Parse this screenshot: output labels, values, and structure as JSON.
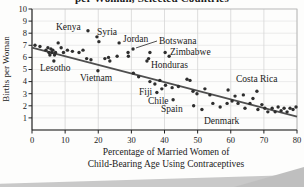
{
  "figure": {
    "xlabel_line1": "Percentage of Married Women of",
    "xlabel_line2": "Child-Bearing Age Using Contraceptives"
  },
  "chart_data": {
    "type": "scatter",
    "title_visible": "per Woman, Selected Countries",
    "xlabel": "Percentage of Married Women of Child-Bearing Age Using Contraceptives",
    "ylabel": "Births per Woman",
    "xlim": [
      0,
      80
    ],
    "ylim": [
      0,
      10
    ],
    "x_ticks": [
      0,
      10,
      20,
      30,
      40,
      50,
      60,
      70,
      80
    ],
    "y_ticks": [
      1,
      2,
      3,
      4,
      5,
      6,
      7,
      8,
      9,
      10
    ],
    "grid": true,
    "legend": "none",
    "trendline": {
      "x1": 0,
      "y1": 6.8,
      "x2": 80,
      "y2": 1.1
    },
    "points": [
      [
        0.9,
        7.0
      ],
      [
        2.4,
        6.9
      ],
      [
        4.2,
        6.6
      ],
      [
        4.8,
        6.8
      ],
      [
        5.1,
        6.4
      ],
      [
        5.4,
        6.2
      ],
      [
        5.7,
        6.7
      ],
      [
        6.0,
        6.4
      ],
      [
        6.3,
        6.6
      ],
      [
        6.8,
        6.2
      ],
      [
        7.1,
        6.4
      ],
      [
        6.6,
        5.7
      ],
      [
        7.9,
        7.2
      ],
      [
        8.8,
        6.8
      ],
      [
        9.5,
        6.4
      ],
      [
        10.7,
        6.6
      ],
      [
        12.2,
        6.5
      ],
      [
        14.2,
        6.4
      ],
      [
        15.4,
        6.6
      ],
      [
        16.9,
        8.2
      ],
      [
        16.5,
        5.9
      ],
      [
        17.8,
        5.8
      ],
      [
        19.6,
        7.7
      ],
      [
        19.9,
        4.9
      ],
      [
        20.2,
        7.3
      ],
      [
        22.0,
        5.9
      ],
      [
        23.1,
        6.0
      ],
      [
        23.5,
        5.7
      ],
      [
        25.7,
        6.1
      ],
      [
        26.3,
        7.2
      ],
      [
        29.0,
        6.4
      ],
      [
        29.1,
        6.1
      ],
      [
        30.5,
        6.7
      ],
      [
        30.6,
        4.7
      ],
      [
        32.2,
        4.4
      ],
      [
        34.7,
        5.7
      ],
      [
        35.2,
        5.9
      ],
      [
        35.6,
        6.4
      ],
      [
        35.6,
        4.0
      ],
      [
        37.1,
        3.8
      ],
      [
        37.7,
        3.1
      ],
      [
        38.6,
        4.1
      ],
      [
        39.2,
        3.4
      ],
      [
        40.2,
        6.4
      ],
      [
        41.4,
        6.1
      ],
      [
        40.3,
        3.7
      ],
      [
        42.3,
        3.5
      ],
      [
        42.6,
        2.5
      ],
      [
        44.2,
        3.6
      ],
      [
        46.8,
        4.2
      ],
      [
        47.7,
        4.1
      ],
      [
        48.6,
        3.2
      ],
      [
        48.8,
        2.0
      ],
      [
        49.8,
        3.0
      ],
      [
        51.3,
        1.7
      ],
      [
        52.2,
        3.4
      ],
      [
        53.7,
        2.9
      ],
      [
        54.6,
        2.2
      ],
      [
        56.8,
        1.9
      ],
      [
        58.9,
        2.2
      ],
      [
        59.2,
        3.3
      ],
      [
        60.4,
        2.4
      ],
      [
        61.3,
        2.8
      ],
      [
        62.2,
        2.2
      ],
      [
        63.8,
        2.9
      ],
      [
        64.3,
        1.8
      ],
      [
        65.8,
        2.2
      ],
      [
        66.7,
        2.6
      ],
      [
        67.9,
        3.2
      ],
      [
        68.2,
        1.7
      ],
      [
        69.4,
        2.1
      ],
      [
        70.3,
        1.8
      ],
      [
        71.2,
        1.5
      ],
      [
        72.5,
        1.8
      ],
      [
        73.4,
        1.5
      ],
      [
        74.3,
        1.9
      ],
      [
        75.2,
        1.6
      ],
      [
        76.1,
        1.8
      ],
      [
        77.0,
        1.5
      ],
      [
        77.9,
        1.8
      ],
      [
        78.8,
        1.7
      ],
      [
        79.7,
        1.9
      ]
    ],
    "labeled_countries": [
      {
        "name": "Kenya",
        "x": 16.9,
        "y": 8.2,
        "label_px": [
          56,
          21
        ],
        "leader": false
      },
      {
        "name": "Syria",
        "x": 19.6,
        "y": 7.7,
        "label_px": [
          97,
          26
        ],
        "leader": false
      },
      {
        "name": "Jordan",
        "x": 26.3,
        "y": 7.2,
        "label_px": [
          123,
          33
        ],
        "leader": false
      },
      {
        "name": "Botswana",
        "x": 30.5,
        "y": 6.7,
        "label_px": [
          159,
          35
        ],
        "leader": true
      },
      {
        "name": "Zimbabwe",
        "x": 40.2,
        "y": 6.4,
        "label_px": [
          170,
          46
        ],
        "leader": false
      },
      {
        "name": "Honduras",
        "x": 34.7,
        "y": 5.7,
        "label_px": [
          151,
          59
        ],
        "leader": false
      },
      {
        "name": "Lesotho",
        "x": 6.6,
        "y": 5.7,
        "label_px": [
          40,
          62
        ],
        "leader": false
      },
      {
        "name": "Vietnam",
        "x": 19.9,
        "y": 4.9,
        "label_px": [
          80,
          72
        ],
        "leader": false
      },
      {
        "name": "Fiji",
        "x": 37.7,
        "y": 3.1,
        "label_px": [
          139,
          86
        ],
        "leader": false
      },
      {
        "name": "Chile",
        "x": 42.6,
        "y": 2.5,
        "label_px": [
          148,
          95
        ],
        "leader": false
      },
      {
        "name": "Spain",
        "x": 48.8,
        "y": 2.0,
        "label_px": [
          161,
          103
        ],
        "leader": false
      },
      {
        "name": "Denmark",
        "x": 54.6,
        "y": 2.2,
        "label_px": [
          204,
          115
        ],
        "leader": false
      },
      {
        "name": "Costa Rica",
        "x": 67.9,
        "y": 3.2,
        "label_px": [
          236,
          73
        ],
        "leader": false
      }
    ],
    "colors": {
      "point": "#2e2e2e",
      "trend": "#4f4f4f",
      "grid_v": "#d6d6d6",
      "grid_h": "#e4e4e4",
      "frame": "#b5b5b5",
      "axis": "#222222",
      "text": "#1a1a1a"
    }
  }
}
